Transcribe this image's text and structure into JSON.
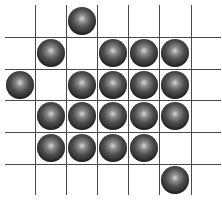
{
  "board": {
    "columns": 7,
    "rows": 6,
    "col_edges": [
      5,
      35,
      66,
      97,
      128,
      159,
      191,
      221
    ],
    "row_edges": [
      5,
      37,
      69,
      100,
      132,
      164,
      195
    ],
    "inner_vertical_lines": [
      35,
      66,
      97,
      128,
      159,
      191
    ],
    "inner_horizontal_lines": [
      37,
      69,
      100,
      132,
      164
    ],
    "line_color": "#4a4a4a",
    "ball_color": "#3a3a3a",
    "pieces": [
      {
        "row": 0,
        "col": 2
      },
      {
        "row": 1,
        "col": 1
      },
      {
        "row": 1,
        "col": 3
      },
      {
        "row": 1,
        "col": 4
      },
      {
        "row": 1,
        "col": 5
      },
      {
        "row": 2,
        "col": 0
      },
      {
        "row": 2,
        "col": 2
      },
      {
        "row": 2,
        "col": 3
      },
      {
        "row": 2,
        "col": 4
      },
      {
        "row": 2,
        "col": 5
      },
      {
        "row": 3,
        "col": 1
      },
      {
        "row": 3,
        "col": 2
      },
      {
        "row": 3,
        "col": 3
      },
      {
        "row": 3,
        "col": 4
      },
      {
        "row": 3,
        "col": 5
      },
      {
        "row": 4,
        "col": 1
      },
      {
        "row": 4,
        "col": 2
      },
      {
        "row": 4,
        "col": 3
      },
      {
        "row": 4,
        "col": 4
      },
      {
        "row": 5,
        "col": 5
      }
    ]
  }
}
